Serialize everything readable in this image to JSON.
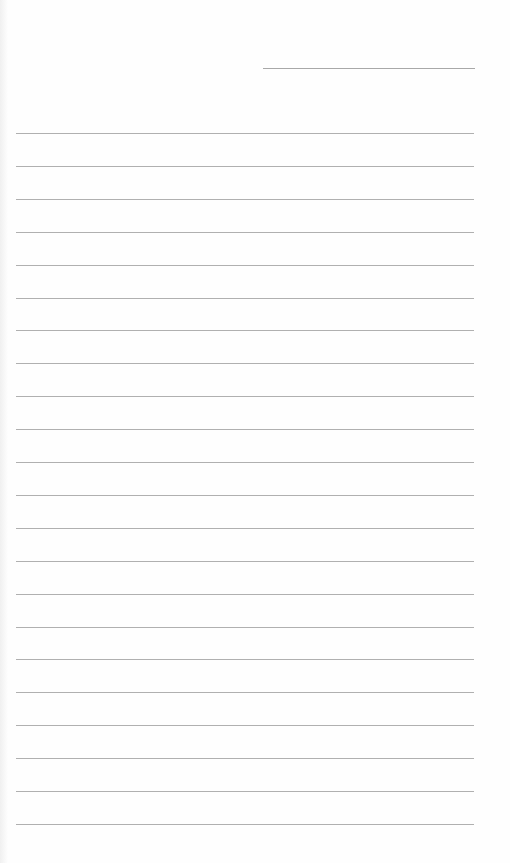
{
  "page": {
    "type": "lined-paper",
    "line_color": "#b0b0b0",
    "background": "#fefefe",
    "header_line": {
      "x": 263,
      "y": 68,
      "width": 212
    },
    "rules": {
      "count": 22,
      "start_y": 133,
      "spacing": 32.9,
      "x": 16,
      "width": 458
    }
  }
}
